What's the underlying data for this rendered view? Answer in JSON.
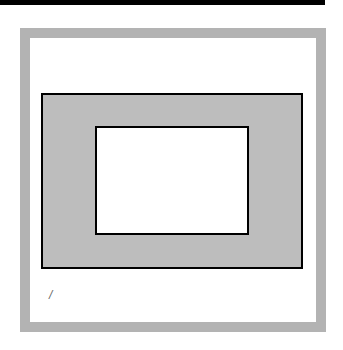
{
  "diagram": {
    "mark_text": "/",
    "colors": {
      "frame": "#b3b3b3",
      "outer_rect_fill": "#bdbdbd",
      "inner_rect_fill": "#ffffff",
      "stroke": "#000000"
    }
  }
}
